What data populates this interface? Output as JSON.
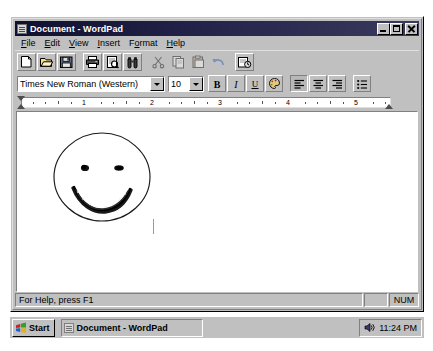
{
  "window": {
    "title": "Document - WordPad",
    "title_icon": "document-icon",
    "controls": [
      {
        "name": "minimize",
        "glyph": "minimize-icon"
      },
      {
        "name": "maximize",
        "glyph": "maximize-icon"
      },
      {
        "name": "close",
        "glyph": "close-icon"
      }
    ]
  },
  "menubar": {
    "items": [
      {
        "label": "File",
        "accel": "F"
      },
      {
        "label": "Edit",
        "accel": "E"
      },
      {
        "label": "View",
        "accel": "V"
      },
      {
        "label": "Insert",
        "accel": "I"
      },
      {
        "label": "Format",
        "accel": "o"
      },
      {
        "label": "Help",
        "accel": "H"
      }
    ]
  },
  "toolbar": {
    "buttons": [
      {
        "name": "new-document-button",
        "icon": "new-page-icon",
        "enabled": true
      },
      {
        "name": "open-button",
        "icon": "open-folder-icon",
        "enabled": true
      },
      {
        "name": "save-button",
        "icon": "floppy-disk-icon",
        "enabled": true
      },
      {
        "name": "print-button",
        "icon": "printer-icon",
        "enabled": true
      },
      {
        "name": "print-preview-button",
        "icon": "print-preview-icon",
        "enabled": true
      },
      {
        "name": "find-button",
        "icon": "binoculars-icon",
        "enabled": true
      },
      {
        "name": "cut-button",
        "icon": "scissors-icon",
        "enabled": false
      },
      {
        "name": "copy-button",
        "icon": "copy-icon",
        "enabled": false
      },
      {
        "name": "paste-button",
        "icon": "clipboard-icon",
        "enabled": false
      },
      {
        "name": "undo-button",
        "icon": "undo-arrow-icon",
        "enabled": false
      },
      {
        "name": "date-time-button",
        "icon": "date-time-icon",
        "enabled": true
      }
    ]
  },
  "formatbar": {
    "font_name": "Times New Roman (Western)",
    "font_size": "10",
    "buttons": [
      {
        "name": "bold-button",
        "label": "B",
        "icon": "bold-icon",
        "pressed": false
      },
      {
        "name": "italic-button",
        "label": "I",
        "icon": "italic-icon",
        "pressed": false
      },
      {
        "name": "underline-button",
        "label": "U",
        "icon": "underline-icon",
        "pressed": false
      },
      {
        "name": "font-color-button",
        "label": "",
        "icon": "color-palette-icon",
        "pressed": false
      },
      {
        "name": "align-left-button",
        "label": "",
        "icon": "align-left-icon",
        "pressed": true
      },
      {
        "name": "align-center-button",
        "label": "",
        "icon": "align-center-icon",
        "pressed": false
      },
      {
        "name": "align-right-button",
        "label": "",
        "icon": "align-right-icon",
        "pressed": false
      },
      {
        "name": "bullets-button",
        "label": "",
        "icon": "bullet-list-icon",
        "pressed": false
      }
    ]
  },
  "ruler": {
    "numbers": [
      "1",
      "2",
      "3",
      "4",
      "5"
    ],
    "unit": "inches",
    "left_indent": "0",
    "right_indent": "6"
  },
  "document": {
    "drawing": "hand-drawn-smiley-face",
    "caret_visible": true,
    "text": ""
  },
  "statusbar": {
    "help_text": "For Help, press F1",
    "blank_pane": "",
    "num_lock": "NUM"
  },
  "taskbar": {
    "start_label": "Start",
    "tasks": [
      {
        "label": "Document - WordPad",
        "icon": "document-icon",
        "active": true
      }
    ],
    "tray": {
      "volume_icon": "speaker-icon",
      "time": "11:24 PM"
    }
  },
  "colors": {
    "window_face": "#c0c0c0",
    "titlebar_active": "#0f0f2e",
    "titlebar_text": "#ffffff",
    "document_bg": "#ffffff",
    "shadow": "#808080",
    "highlight": "#ffffff"
  }
}
